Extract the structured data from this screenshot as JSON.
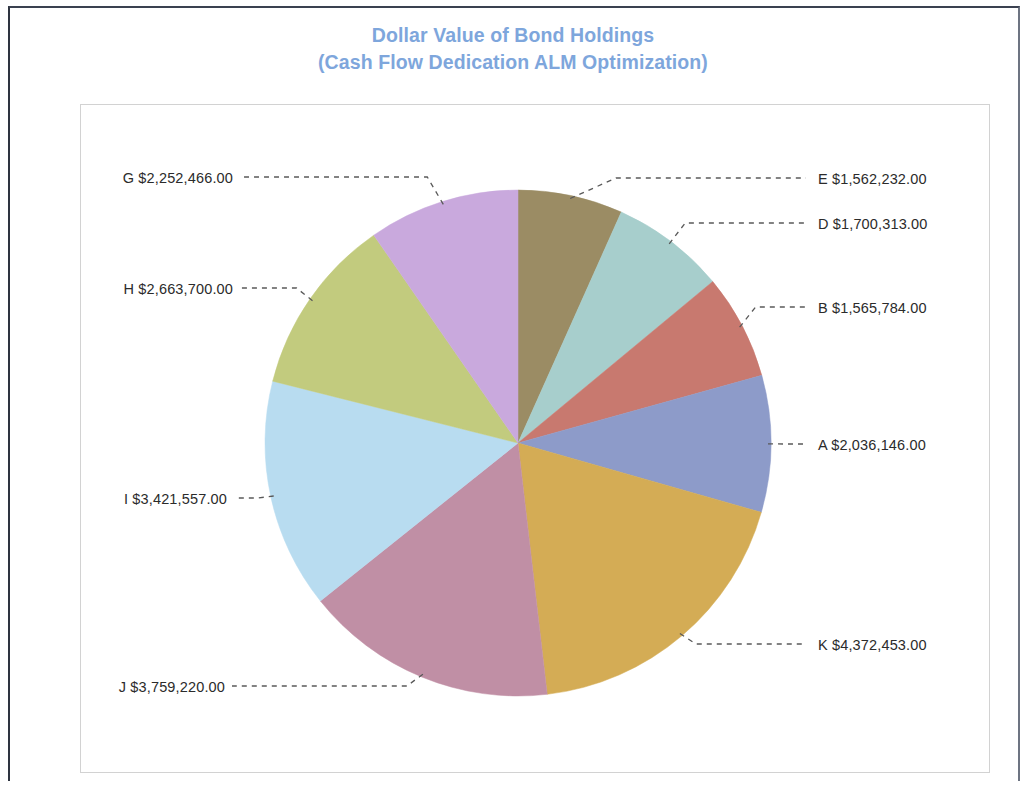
{
  "chart_title": {
    "line1": "Dollar Value of Bond Holdings",
    "line2": "(Cash Flow Dedication ALM Optimization)",
    "color": "#7ea6dc"
  },
  "labels": {
    "E": "E $1,562,232.00",
    "D": "D $1,700,313.00",
    "B": "B $1,565,784.00",
    "A": "A $2,036,146.00",
    "K": "K $4,372,453.00",
    "J": "J $3,759,220.00",
    "I": "I $3,421,557.00",
    "H": "H $2,663,700.00",
    "G": "G $2,252,466.00"
  },
  "chart_data": {
    "type": "pie",
    "title": "Dollar Value of Bond Holdings (Cash Flow Dedication ALM Optimization)",
    "xlabel": "",
    "ylabel": "",
    "value_prefix": "$",
    "total": 23333871,
    "legend_position": "none",
    "grid": false,
    "labels_style": "outside-with-leader-lines",
    "start_angle_deg": 0,
    "direction": "clockwise",
    "categories": [
      "E",
      "D",
      "B",
      "A",
      "K",
      "J",
      "I",
      "H",
      "G"
    ],
    "values": [
      1562232,
      1700313,
      1565784,
      2036146,
      4372453,
      3759220,
      3421557,
      2663700,
      2252466
    ],
    "display_values": [
      "$1,562,232.00",
      "$1,700,313.00",
      "$1,565,784.00",
      "$2,036,146.00",
      "$4,372,453.00",
      "$3,759,220.00",
      "$3,421,557.00",
      "$2,663,700.00",
      "$2,252,466.00"
    ],
    "colors": [
      "#9b8c64",
      "#a7cecc",
      "#c8796f",
      "#8d9bc9",
      "#d4ac55",
      "#c08fa5",
      "#b8dcf0",
      "#c2cb7e",
      "#c9a9dd"
    ],
    "slices": [
      {
        "name": "E",
        "label": "E $1,562,232.00",
        "value": 1562232,
        "color": "#9b8c64",
        "percent": 6.7
      },
      {
        "name": "D",
        "label": "D $1,700,313.00",
        "value": 1700313,
        "color": "#a7cecc",
        "percent": 7.3
      },
      {
        "name": "B",
        "label": "B $1,565,784.00",
        "value": 1565784,
        "color": "#c8796f",
        "percent": 6.7
      },
      {
        "name": "A",
        "label": "A $2,036,146.00",
        "value": 2036146,
        "color": "#8d9bc9",
        "percent": 8.7
      },
      {
        "name": "K",
        "label": "K $4,372,453.00",
        "value": 4372453,
        "color": "#d4ac55",
        "percent": 18.7
      },
      {
        "name": "J",
        "label": "J $3,759,220.00",
        "value": 3759220,
        "color": "#c08fa5",
        "percent": 16.1
      },
      {
        "name": "I",
        "label": "I $3,421,557.00",
        "value": 3421557,
        "color": "#b8dcf0",
        "percent": 14.7
      },
      {
        "name": "H",
        "label": "H $2,663,700.00",
        "value": 2663700,
        "color": "#c2cb7e",
        "percent": 11.4
      },
      {
        "name": "G",
        "label": "G $2,252,466.00",
        "value": 2252466,
        "color": "#c9a9dd",
        "percent": 9.7
      }
    ]
  }
}
